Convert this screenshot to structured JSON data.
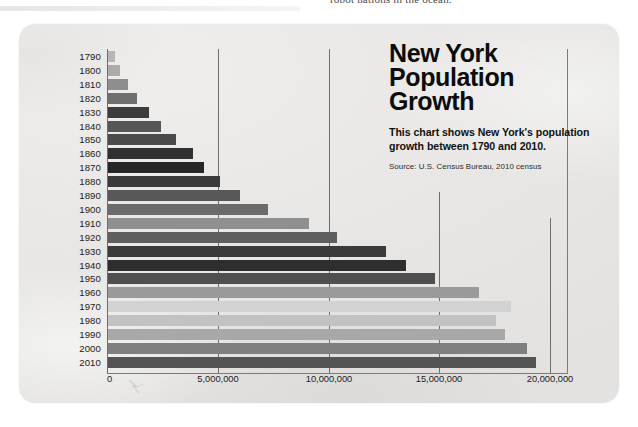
{
  "page_bleed": {
    "text": "robot nations in the ocean."
  },
  "title": {
    "text": "New York\nPopulation\nGrowth"
  },
  "description": "This chart shows New York's population growth between 1790 and 2010.",
  "source": "Source: U.S. Census Bureau, 2010 census",
  "colors": {
    "card_background": "#e9e8e6",
    "gridline": "#6d6d6d",
    "text": "#111111",
    "bar_light": "#b9b9b9",
    "bar_dark": "#2f2f2f"
  },
  "chart_data": {
    "type": "bar",
    "orientation": "horizontal",
    "title": "New York Population Growth",
    "subtitle": "This chart shows New York's population growth between 1790 and 2010.",
    "source": "Source: U.S. Census Bureau, 2010 census",
    "xlabel": "",
    "ylabel": "",
    "xlim": [
      0,
      20000000
    ],
    "xticks": [
      0,
      5000000,
      10000000,
      15000000,
      20000000
    ],
    "xtick_labels": [
      "0",
      "5,000,000",
      "10,000,000",
      "15,000,000",
      "20,000,000"
    ],
    "grid": "vertical",
    "legend": "none",
    "categories": [
      "1790",
      "1800",
      "1810",
      "1820",
      "1830",
      "1840",
      "1850",
      "1860",
      "1870",
      "1880",
      "1890",
      "1900",
      "1910",
      "1920",
      "1930",
      "1940",
      "1950",
      "1960",
      "1970",
      "1980",
      "1990",
      "2000",
      "2010"
    ],
    "values": [
      340120,
      589051,
      959049,
      1372812,
      1918608,
      2428921,
      3097394,
      3880735,
      4382759,
      5082871,
      6003174,
      7268894,
      9113614,
      10385227,
      12588066,
      13479142,
      14830192,
      16782304,
      18236967,
      17558072,
      17990455,
      18976457,
      19378102
    ],
    "bar_colors": [
      "#b6b6b6",
      "#ababab",
      "#8e8e8e",
      "#6f6f6f",
      "#3c3c3c",
      "#565656",
      "#4a4a4a",
      "#303030",
      "#262626",
      "#3a3a3a",
      "#585858",
      "#6b6b6b",
      "#8f8f8f",
      "#5e5e5e",
      "#3a3a3a",
      "#2e2e2e",
      "#4f4f4f",
      "#9a9a9a",
      "#d2d2d2",
      "#c2c2c2",
      "#a8a8a8",
      "#7f7f7f",
      "#545454"
    ]
  }
}
